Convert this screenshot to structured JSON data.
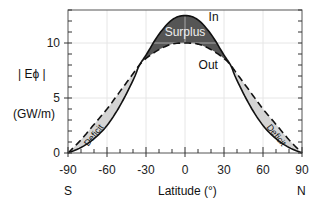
{
  "chart_data": {
    "type": "line",
    "title": "",
    "xlabel": "Latitude (°)",
    "ylabel_line1": "| Eϕ |",
    "ylabel_line2": "(GW/m)",
    "xlim": [
      -90,
      90
    ],
    "ylim": [
      0,
      13
    ],
    "x_ticks": [
      -90,
      -60,
      -30,
      0,
      30,
      60,
      90
    ],
    "x_tick_labels": [
      "-90",
      "-60",
      "-30",
      "0",
      "30",
      "60",
      "90"
    ],
    "x_sub_labels": {
      "left": "S",
      "right": "N"
    },
    "y_ticks": [
      0,
      5,
      10
    ],
    "y_tick_labels": [
      "0",
      "5",
      "10"
    ],
    "grid": true,
    "series": [
      {
        "name": "In",
        "style": "solid",
        "x": [
          -90,
          -80,
          -70,
          -60,
          -50,
          -40,
          -35,
          -30,
          -20,
          -10,
          0,
          10,
          20,
          30,
          35,
          40,
          50,
          60,
          70,
          80,
          90
        ],
        "values": [
          0,
          0.5,
          1.3,
          2.5,
          4.3,
          6.6,
          8.0,
          8.9,
          10.8,
          12.1,
          12.5,
          12.1,
          10.8,
          8.9,
          8.0,
          6.6,
          4.3,
          2.5,
          1.3,
          0.5,
          0
        ]
      },
      {
        "name": "Out",
        "style": "dashed",
        "x": [
          -90,
          -80,
          -70,
          -60,
          -50,
          -40,
          -35,
          -30,
          -20,
          -10,
          0,
          10,
          20,
          30,
          35,
          40,
          50,
          60,
          70,
          80,
          90
        ],
        "values": [
          0,
          1.2,
          2.6,
          4.0,
          5.6,
          7.2,
          8.0,
          8.6,
          9.4,
          9.9,
          10.0,
          9.9,
          9.4,
          8.6,
          8.0,
          7.2,
          5.6,
          4.0,
          2.6,
          1.2,
          0
        ]
      }
    ],
    "annotations": [
      {
        "text": "In",
        "x": 12,
        "y": 12.2
      },
      {
        "text": "Out",
        "x": 12,
        "y": 7.8
      },
      {
        "text": "Surplus",
        "x": 0,
        "y": 10.8,
        "region": "between curves, -35 to 35, dark fill"
      },
      {
        "text": "Deficit",
        "x": -70,
        "y": 2.0,
        "region": "between curves, -90 to -35, light fill"
      },
      {
        "text": "Deficit",
        "x": 70,
        "y": 2.0,
        "region": "between curves, 35 to 90, light fill"
      }
    ],
    "colors": {
      "surplus_fill": "#555555",
      "deficit_fill": "#d4d4d4",
      "line": "#111111",
      "grid": "#e6e6e6"
    }
  }
}
